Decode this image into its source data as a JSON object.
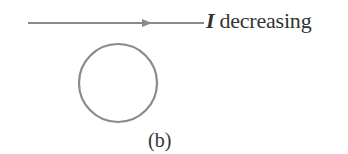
{
  "figure": {
    "wire": {
      "current_symbol": "I",
      "current_state": "decreasing",
      "direction": "right",
      "color": "#8a8a8a"
    },
    "loop": {
      "shape": "circle",
      "color": "#8a8a8a"
    },
    "caption": "(b)"
  }
}
